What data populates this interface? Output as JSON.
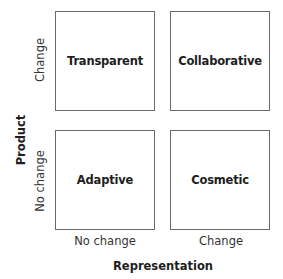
{
  "diagram": {
    "y_axis": {
      "label": "Product",
      "levels": [
        "Change",
        "No change"
      ]
    },
    "x_axis": {
      "label": "Representation",
      "levels": [
        "No change",
        "Change"
      ]
    },
    "quadrants": {
      "top_left": "Transparent",
      "top_right": "Collaborative",
      "bottom_left": "Adaptive",
      "bottom_right": "Cosmetic"
    }
  }
}
